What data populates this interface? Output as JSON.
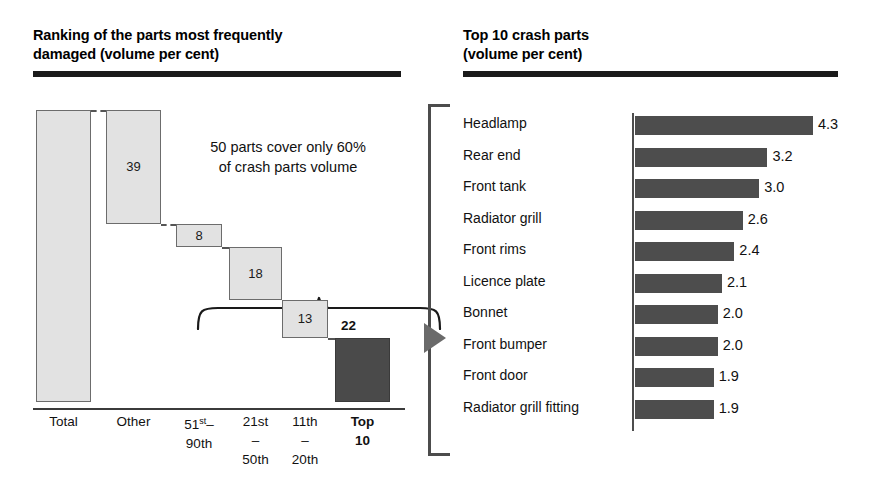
{
  "left_panel": {
    "title": "Ranking of the parts most frequently\ndamaged (volume per cent)",
    "callout": "50 parts cover only 60%\nof crash parts volume",
    "axis_labels": [
      "Total",
      "Other",
      "51st–\n90th",
      "21st\n–\n50th",
      "11th\n–\n20th",
      "Top\n10"
    ]
  },
  "right_panel": {
    "title": "Top 10 crash parts\n(volume per cent)"
  },
  "colors": {
    "light_bar": "#e2e2e2",
    "dark_bar": "#4d4d4d",
    "rule": "#1a1a1a",
    "bracket": "#4c4c4c"
  },
  "chart_data": [
    {
      "type": "bar",
      "title": "Ranking of the parts most frequently damaged (volume per cent)",
      "subtitle": "50 parts cover only 60% of crash parts volume",
      "xlabel": "",
      "ylabel": "volume per cent",
      "ylim": [
        0,
        100
      ],
      "grid": false,
      "legend": "none",
      "waterfall": true,
      "categories": [
        "Total",
        "Other",
        "51st–90th",
        "21st–50th",
        "11th–20th",
        "Top 10"
      ],
      "values": [
        100,
        39,
        8,
        18,
        13,
        22
      ],
      "labels": [
        "",
        "39",
        "8",
        "18",
        "13",
        "22"
      ],
      "cumulative_top": [
        100,
        100,
        61,
        53,
        35,
        22
      ],
      "cumulative_bottom": [
        0,
        61,
        53,
        35,
        22,
        0
      ],
      "highlight_index": 5,
      "annotation": "50 parts cover only 60% of crash parts volume"
    },
    {
      "type": "bar",
      "orientation": "horizontal",
      "title": "Top 10 crash parts (volume per cent)",
      "xlabel": "volume per cent",
      "ylabel": "",
      "xlim": [
        0,
        4.3
      ],
      "grid": false,
      "legend": "none",
      "categories": [
        "Headlamp",
        "Rear end",
        "Front tank",
        "Radiator grill",
        "Front rims",
        "Licence plate",
        "Bonnet",
        "Front bumper",
        "Front door",
        "Radiator grill fitting"
      ],
      "values": [
        4.3,
        3.2,
        3.0,
        2.6,
        2.4,
        2.1,
        2.0,
        2.0,
        1.9,
        1.9
      ],
      "value_labels": [
        "4.3",
        "3.2",
        "3.0",
        "2.6",
        "2.4",
        "2.1",
        "2.0",
        "2.0",
        "1.9",
        "1.9"
      ]
    }
  ]
}
